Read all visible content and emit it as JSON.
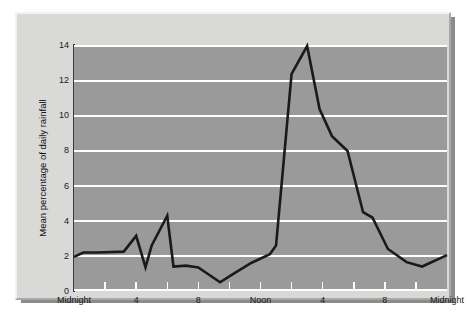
{
  "chart_data": {
    "type": "line",
    "title": "",
    "subtitle": "",
    "xlabel": "",
    "ylabel": "Mean percentage of daily rainfall",
    "xlim": [
      0,
      24
    ],
    "ylim": [
      0,
      14
    ],
    "yticks": [
      0,
      2,
      4,
      6,
      8,
      10,
      12,
      14
    ],
    "ytick_labels": [
      "0",
      "2",
      "4",
      "6",
      "8",
      "10",
      "12",
      "14"
    ],
    "xticks": [
      0,
      2,
      4,
      6,
      8,
      10,
      12,
      14,
      16,
      18,
      20,
      22,
      24
    ],
    "xtick_labels": [
      "Midnight",
      "",
      "4",
      "",
      "8",
      "",
      "Noon",
      "",
      "4",
      "",
      "8",
      "",
      "Midnight"
    ],
    "xtick_labels_shown": [
      "Midnight",
      "4",
      "8",
      "Noon",
      "4",
      "8",
      "Midnight"
    ],
    "xtick_labels_shown_at": [
      0,
      4,
      8,
      12,
      16,
      20,
      24
    ],
    "grid": "horizontal",
    "grid_color": "#ffffff",
    "plot_background": "#9a9a9a",
    "line_color": "#1a1a1a",
    "line_width": 2.6,
    "legend": null,
    "legend_position": "none",
    "x": [
      0,
      0.6,
      1.5,
      3.2,
      4.0,
      4.6,
      5.0,
      6.0,
      6.4,
      7.2,
      8.0,
      9.4,
      10.2,
      11.4,
      12.6,
      13.0,
      14.0,
      15.0,
      15.8,
      16.6,
      17.6,
      18.6,
      19.2,
      20.2,
      21.4,
      22.4,
      24.0
    ],
    "y": [
      1.95,
      2.2,
      2.2,
      2.25,
      3.15,
      1.35,
      2.6,
      4.3,
      1.4,
      1.45,
      1.35,
      0.5,
      0.95,
      1.6,
      2.1,
      2.6,
      12.4,
      14.0,
      10.4,
      8.85,
      8.0,
      4.5,
      4.2,
      2.4,
      1.65,
      1.4,
      2.05
    ],
    "series": [
      {
        "name": "Mean percentage of daily rainfall",
        "values": [
          1.95,
          2.2,
          2.2,
          2.25,
          3.15,
          1.35,
          2.6,
          4.3,
          1.4,
          1.45,
          1.35,
          0.5,
          0.95,
          1.6,
          2.1,
          2.6,
          12.4,
          14.0,
          10.4,
          8.85,
          8.0,
          4.5,
          4.2,
          2.4,
          1.65,
          1.4,
          2.05
        ]
      }
    ],
    "notes": {
      "peak_value": 14.0,
      "peak_time": "3 pm",
      "minimum_value": 0.5,
      "minimum_time": "9 am",
      "secondary_peak_value": 4.3,
      "secondary_peak_time": "6 am"
    }
  },
  "figure": {
    "frame_color": "#d9d9d7",
    "shadow_color": "#8c8c8c"
  }
}
